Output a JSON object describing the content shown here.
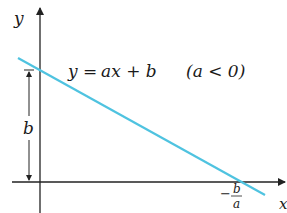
{
  "diagram": {
    "axes": {
      "x_label": "x",
      "y_label": "y"
    },
    "equation": {
      "lhs": "y",
      "eq": "=",
      "rhs": "ax + b",
      "condition": "(a < 0)"
    },
    "intercepts": {
      "y_intercept_label": "b",
      "x_intercept_sign": "−",
      "x_intercept_num": "b",
      "x_intercept_den": "a"
    },
    "colors": {
      "line": "#4fc3e0",
      "axes": "#222222",
      "text": "#1a1a1a"
    }
  }
}
